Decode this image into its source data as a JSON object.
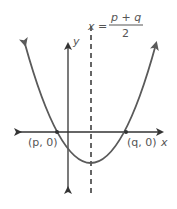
{
  "diagram": {
    "axis_of_symmetry": {
      "lhs": "x",
      "equals": "=",
      "numerator": "p + q",
      "denominator": "2"
    },
    "axes": {
      "x_label": "x",
      "y_label": "y"
    },
    "points": [
      {
        "label": "(p, 0)",
        "name": "left-x-intercept"
      },
      {
        "label": "(q, 0)",
        "name": "right-x-intercept"
      }
    ],
    "colors": {
      "curve": "#5a5a5a",
      "axes": "#333333",
      "text": "#555555",
      "background": "#ffffff"
    }
  }
}
